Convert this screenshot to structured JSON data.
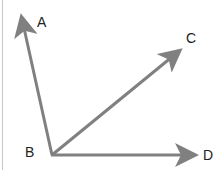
{
  "diagram": {
    "type": "angle-rays",
    "line_color": "#808080",
    "label_color": "#222222",
    "vertex": {
      "label": "B",
      "x": 52,
      "y": 155
    },
    "rays": [
      {
        "name": "BA",
        "label": "A",
        "tip": [
          20,
          12
        ]
      },
      {
        "name": "BC",
        "label": "C",
        "tip": [
          183,
          48
        ]
      },
      {
        "name": "BD",
        "label": "D",
        "tip": [
          200,
          155
        ]
      }
    ],
    "labels": {
      "A": "A",
      "B": "B",
      "C": "C",
      "D": "D"
    }
  }
}
